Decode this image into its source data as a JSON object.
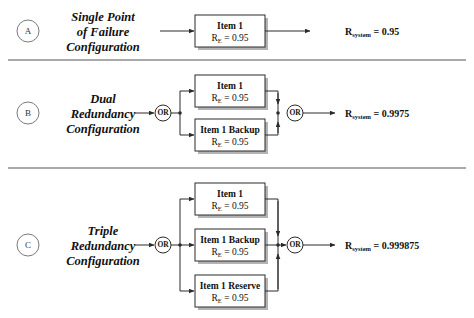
{
  "figure": {
    "colors": {
      "box_fill": "#ffffff",
      "box_stroke": "#2b2b2b",
      "shadow": "#b3b3b3",
      "wire": "#2b2b2b",
      "divider": "#8c8c8c",
      "text": "#111111",
      "marker_stroke": "#7a7a7a"
    },
    "gate_label": "OR",
    "reliability_symbol": "R",
    "reliability_subscript": "E",
    "system_symbol": "R",
    "system_subscript": "system",
    "equals": "="
  },
  "sections": [
    {
      "marker": "A",
      "title_lines": [
        "Single Point",
        "of Failure",
        "Configuration"
      ],
      "type": "series",
      "blocks": [
        {
          "name": "Item 1",
          "reliability": "0.95",
          "rel_text": "R_E = 0.95"
        }
      ],
      "result_label": "R_system",
      "result_value": "0.95",
      "result_text": "R_system = 0.95"
    },
    {
      "marker": "B",
      "title_lines": [
        "Dual",
        "Redundancy",
        "Configuration"
      ],
      "type": "parallel",
      "blocks": [
        {
          "name": "Item 1",
          "reliability": "0.95",
          "rel_text": "R_E = 0.95"
        },
        {
          "name": "Item 1 Backup",
          "reliability": "0.95",
          "rel_text": "R_E = 0.95"
        }
      ],
      "result_label": "R_system",
      "result_value": "0.9975",
      "result_text": "R_system = 0.9975"
    },
    {
      "marker": "C",
      "title_lines": [
        "Triple",
        "Redundancy",
        "Configuration"
      ],
      "type": "parallel",
      "blocks": [
        {
          "name": "Item 1",
          "reliability": "0.95",
          "rel_text": "R_E = 0.95"
        },
        {
          "name": "Item 1 Backup",
          "reliability": "0.95",
          "rel_text": "R_E = 0.95"
        },
        {
          "name": "Item 1 Reserve",
          "reliability": "0.95",
          "rel_text": "R_E = 0.95"
        }
      ],
      "result_label": "R_system",
      "result_value": "0.999875",
      "result_text": "R_system = 0.999875"
    }
  ],
  "dividers": [
    {
      "y": 60
    },
    {
      "y": 168
    }
  ]
}
